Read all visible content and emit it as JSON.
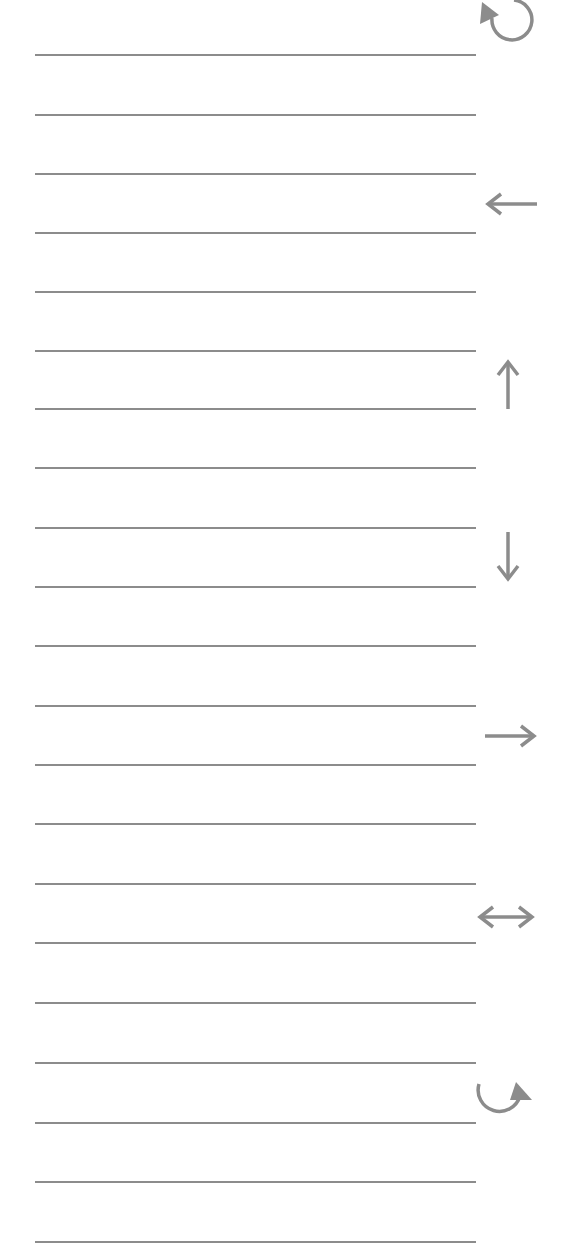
{
  "page": {
    "background": "#ffffff",
    "line_color": "#8c8c8c",
    "icon_color": "#8c8c8c"
  },
  "lines": {
    "count": 20,
    "x_start": 35,
    "x_end": 476,
    "y_positions": [
      55,
      115,
      174,
      233,
      292,
      351,
      409,
      468,
      528,
      587,
      646,
      706,
      765,
      824,
      884,
      943,
      1003,
      1063,
      1123,
      1182,
      1242
    ]
  },
  "icons": [
    {
      "name": "rotate-counterclockwise-icon",
      "label": "↺"
    },
    {
      "name": "arrow-left-icon",
      "label": "←"
    },
    {
      "name": "arrow-up-icon",
      "label": "↑"
    },
    {
      "name": "arrow-down-icon",
      "label": "↓"
    },
    {
      "name": "arrow-right-icon",
      "label": "→"
    },
    {
      "name": "arrow-left-right-icon",
      "label": "↔"
    },
    {
      "name": "rotate-clockwise-icon",
      "label": "↻"
    }
  ]
}
